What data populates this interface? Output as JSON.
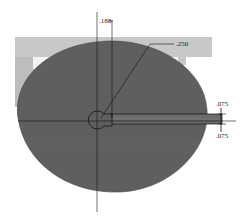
{
  "drawing": {
    "type": "cad-sketch",
    "colors": {
      "background": "#ffffff",
      "frame": "#c8c8c8",
      "frame_inner": "#f4f4f4",
      "frame_side": "#a8a8a8",
      "body_fill": "#5f5f5f",
      "line": "#111111"
    },
    "dimensions": {
      "top_offset": ".188",
      "radius_leader": ".250",
      "slot_upper": ".075",
      "slot_lower": ".075"
    }
  }
}
